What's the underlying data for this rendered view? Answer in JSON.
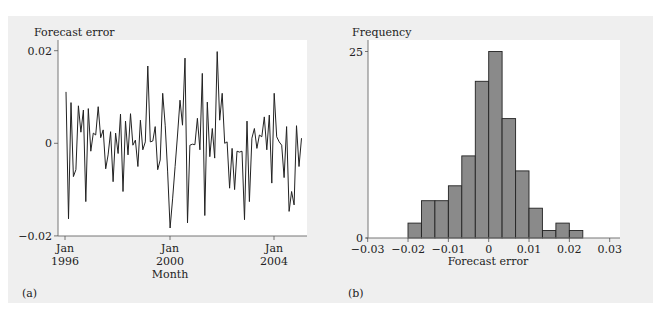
{
  "figure": {
    "panels": [
      {
        "id": "a",
        "caption": "(a)"
      },
      {
        "id": "b",
        "caption": "(b)"
      }
    ]
  },
  "chart_data": [
    {
      "type": "line",
      "panel": "(a)",
      "title": "",
      "ylabel": "Forecast error",
      "xlabel": "Month",
      "ylim": [
        -0.02,
        0.02
      ],
      "yticks": [
        "0.02",
        "0",
        "−0.02"
      ],
      "ytick_values": [
        0.02,
        0,
        -0.02
      ],
      "xticks": [
        {
          "line1": "Jan",
          "line2": "1996"
        },
        {
          "line1": "Jan",
          "line2": "2000"
        },
        {
          "line1": "Jan",
          "line2": "2004"
        }
      ],
      "x_start": "Jan 1996",
      "x_end": "Jan 2005",
      "grid": false,
      "series": [
        {
          "name": "Forecast error",
          "values": [
            0.0111,
            -0.0163,
            0.0088,
            -0.0072,
            -0.0057,
            0.0081,
            0.0024,
            0.0072,
            -0.0126,
            0.0075,
            -0.0017,
            0.0022,
            0.0018,
            0.0079,
            0.0012,
            0.0029,
            -0.0055,
            -0.0025,
            0.0025,
            -0.0083,
            0.0022,
            -0.0022,
            0.0063,
            -0.0104,
            0.0048,
            -0.0025,
            0.0064,
            -0.0004,
            0.0007,
            -0.005,
            0.005,
            -0.0014,
            0.0003,
            0.0167,
            0.0003,
            0.0005,
            0.0036,
            -0.0057,
            -0.0036,
            0.0108,
            0.0039,
            -0.006,
            -0.0183,
            -0.012,
            -0.005,
            0.002,
            0.0093,
            0.0039,
            0.0184,
            -0.0172,
            -0.0004,
            -0.0002,
            -0.0003,
            0.0054,
            -0.0014,
            0.0151,
            -0.0156,
            0.0089,
            -0.0029,
            0.0032,
            -0.0032,
            0.0198,
            0.005,
            0.0108,
            0.0,
            0.0003,
            -0.0097,
            -0.0011,
            -0.01,
            -0.0017,
            -0.0019,
            -0.0017,
            -0.0165,
            0.0048,
            -0.0126,
            0.0011,
            0.0032,
            -0.0011,
            0.0018,
            0.0014,
            0.0057,
            -0.0014,
            0.0061,
            -0.0086,
            0.0108,
            0.0014,
            0.0003,
            -0.0004,
            -0.0074,
            0.0036,
            -0.0147,
            -0.0104,
            -0.0133,
            0.0038,
            -0.005,
            0.0011
          ]
        }
      ]
    },
    {
      "type": "bar",
      "subtype": "histogram",
      "panel": "(b)",
      "title": "",
      "ylabel": "Frequency",
      "xlabel": "Forecast error",
      "ylim": [
        0,
        25
      ],
      "xlim": [
        -0.03,
        0.03
      ],
      "yticks": [
        "25",
        "0"
      ],
      "ytick_values": [
        25,
        0
      ],
      "xticks": [
        "−0.03",
        "−0.02",
        "−0.01",
        "0",
        "0.01",
        "0.02",
        "0.03"
      ],
      "xtick_values": [
        -0.03,
        -0.02,
        -0.01,
        0,
        0.01,
        0.02,
        0.03
      ],
      "bin_width": 0.00333,
      "bin_edges": [
        -0.02,
        -0.01667,
        -0.01333,
        -0.01,
        -0.00667,
        -0.00333,
        0,
        0.00333,
        0.00667,
        0.01,
        0.01333,
        0.01667,
        0.02,
        0.02333
      ],
      "values": [
        2,
        5,
        5,
        7,
        11,
        21,
        25,
        16,
        9,
        4,
        1,
        2,
        1
      ],
      "bar_color": "#8a8a8a",
      "grid": false
    }
  ]
}
